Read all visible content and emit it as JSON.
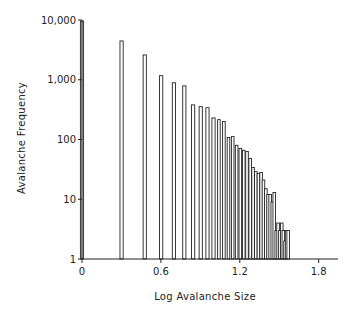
{
  "chart_data": {
    "type": "bar",
    "title": "",
    "xlabel": "Log Avalanche Size",
    "ylabel": "Avalanche Frequency",
    "yscale": "log",
    "xlim": [
      0,
      1.9
    ],
    "ylim": [
      1,
      10000
    ],
    "grid": false,
    "legend": null,
    "x_ticks": [
      0,
      0.6,
      1.2,
      1.8
    ],
    "x_tick_labels": [
      "0",
      "0.6",
      "1.2",
      "1.8"
    ],
    "y_ticks": [
      1,
      10,
      100,
      1000,
      10000
    ],
    "y_tick_labels": [
      "1",
      "10",
      "100",
      "1,000",
      "10,000"
    ],
    "x": [
      0.0,
      0.301,
      0.477,
      0.602,
      0.699,
      0.778,
      0.845,
      0.903,
      0.954,
      1.0,
      1.041,
      1.079,
      1.114,
      1.146,
      1.176,
      1.204,
      1.23,
      1.255,
      1.279,
      1.301,
      1.322,
      1.342,
      1.362,
      1.38,
      1.398,
      1.415,
      1.431,
      1.447,
      1.462,
      1.477,
      1.491,
      1.505,
      1.519,
      1.531,
      1.544,
      1.556,
      1.568
    ],
    "values": [
      9600,
      4460,
      2600,
      1170,
      890,
      790,
      380,
      355,
      340,
      230,
      215,
      200,
      108,
      112,
      80,
      71,
      66,
      63,
      48,
      34,
      29,
      27,
      28,
      21,
      15,
      12,
      12,
      9,
      13,
      3,
      4,
      3,
      4,
      3,
      2,
      3,
      3
    ]
  }
}
